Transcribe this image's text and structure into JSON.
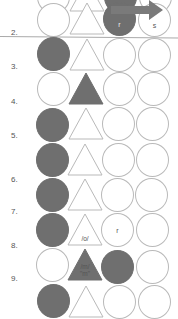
{
  "colors": {
    "filled": "#6f6f6f",
    "outline": "#b9b9b9",
    "label": "#555555"
  },
  "rows": [
    {
      "label": "1.",
      "y": -16,
      "shapes": [
        "empty",
        "empty",
        "filled",
        "empty"
      ],
      "texts": [
        "",
        "",
        "",
        ""
      ]
    },
    {
      "label": "2.",
      "y": 3,
      "shapes": [
        "empty",
        "empty",
        "filled",
        "empty"
      ],
      "texts": [
        "",
        "",
        "r",
        "s"
      ]
    },
    {
      "label": "3.",
      "y": 37,
      "shapes": [
        "filled",
        "empty",
        "empty",
        "empty"
      ],
      "texts": [
        "",
        "",
        "",
        ""
      ]
    },
    {
      "label": "4.",
      "y": 71,
      "shapes": [
        "empty",
        "filled",
        "empty",
        "empty"
      ],
      "texts": [
        "",
        "",
        "",
        ""
      ]
    },
    {
      "label": "5.",
      "y": 104,
      "shapes": [
        "filled",
        "empty",
        "empty",
        "empty"
      ],
      "texts": [
        "",
        "",
        "",
        ""
      ]
    },
    {
      "label": "6.",
      "y": 140,
      "shapes": [
        "filled",
        "empty",
        "empty",
        "empty"
      ],
      "texts": [
        "",
        "",
        "",
        ""
      ]
    },
    {
      "label": "7.",
      "y": 175,
      "shapes": [
        "filled",
        "empty",
        "empty",
        "empty"
      ],
      "texts": [
        "",
        "",
        "",
        ""
      ]
    },
    {
      "label": "8.",
      "y": 210,
      "shapes": [
        "filled",
        "empty",
        "empty",
        "empty"
      ],
      "texts": [
        "",
        "/o/",
        "r",
        ""
      ]
    },
    {
      "label": "9.",
      "y": 245,
      "shapes": [
        "empty",
        "filled",
        "filled",
        "empty"
      ],
      "texts": [
        "",
        "/m/ \"m\"",
        "",
        ""
      ]
    },
    {
      "label": "10.",
      "y": 280,
      "shapes": [
        "filled",
        "empty",
        "empty",
        "empty"
      ],
      "texts": [
        "",
        "",
        "",
        ""
      ]
    }
  ],
  "row_labels": {
    "r2": "2.",
    "r3": "3.",
    "r4": "4.",
    "r5": "5.",
    "r6": "6.",
    "r7": "7.",
    "r8": "8.",
    "r9": "9."
  },
  "annotations": {
    "r2_c3": "r",
    "r2_c4": "s",
    "r8_c2": "/o/",
    "r8_c3": "r",
    "r9_c2_line1": "/m/",
    "r9_c2_line2": "\"m\""
  }
}
